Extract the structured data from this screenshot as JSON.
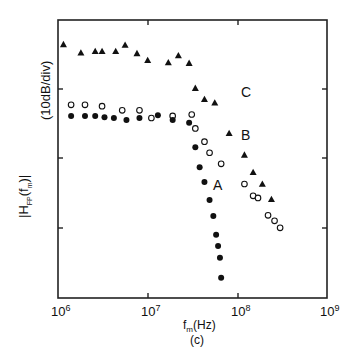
{
  "chart_data": {
    "type": "scatter",
    "title": "",
    "panel_label": "(c)",
    "xlabel": "f_m(Hz)",
    "ylabel": "|H_FP(f_m)|",
    "ylabel_units": "(10dB/div)",
    "xscale": "log",
    "xlim": [
      1000000,
      1000000000
    ],
    "xticks": [
      "10^6",
      "10^7",
      "10^8",
      "10^9"
    ],
    "yscale": "dB, 10 dB per division, 4 divisions, relative",
    "ylim_div": [
      0,
      4
    ],
    "grid": false,
    "legend": "inline curve labels A, B, C",
    "series": [
      {
        "name": "C",
        "marker": "filled-triangle",
        "points": [
          [
            1150000.0,
            3.65
          ],
          [
            1800000.0,
            3.53
          ],
          [
            2600000.0,
            3.55
          ],
          [
            3100000.0,
            3.55
          ],
          [
            4400000.0,
            3.55
          ],
          [
            5600000.0,
            3.64
          ],
          [
            7600000.0,
            3.52
          ],
          [
            10000000.0,
            3.42
          ],
          [
            17000000.0,
            3.39
          ],
          [
            22000000.0,
            3.49
          ],
          [
            29000000.0,
            3.38
          ],
          [
            34000000.0,
            3.02
          ],
          [
            43000000.0,
            2.86
          ],
          [
            56000000.0,
            2.81
          ],
          [
            81000000.0,
            2.37
          ],
          [
            120000000.0,
            2.06
          ],
          [
            150000000.0,
            1.81
          ],
          [
            190000000.0,
            1.64
          ],
          [
            240000000.0,
            1.42
          ]
        ]
      },
      {
        "name": "B",
        "marker": "open-circle",
        "points": [
          [
            1400000.0,
            2.78
          ],
          [
            2000000.0,
            2.78
          ],
          [
            3100000.0,
            2.76
          ],
          [
            5200000.0,
            2.7
          ],
          [
            8100000.0,
            2.7
          ],
          [
            11000000.0,
            2.59
          ],
          [
            19000000.0,
            2.62
          ],
          [
            31000000.0,
            2.64
          ],
          [
            34000000.0,
            2.44
          ],
          [
            43000000.0,
            2.25
          ],
          [
            49000000.0,
            2.09
          ],
          [
            66000000.0,
            1.93
          ],
          [
            120000000.0,
            1.64
          ],
          [
            150000000.0,
            1.47
          ],
          [
            170000000.0,
            1.44
          ],
          [
            220000000.0,
            1.19
          ],
          [
            260000000.0,
            1.11
          ],
          [
            300000000.0,
            1.01
          ]
        ]
      },
      {
        "name": "A",
        "marker": "filled-circle",
        "points": [
          [
            1400000.0,
            2.62
          ],
          [
            2000000.0,
            2.62
          ],
          [
            2600000.0,
            2.62
          ],
          [
            3300000.0,
            2.6
          ],
          [
            4200000.0,
            2.59
          ],
          [
            5800000.0,
            2.56
          ],
          [
            8100000.0,
            2.59
          ],
          [
            13000000.0,
            2.63
          ],
          [
            19000000.0,
            2.56
          ],
          [
            29000000.0,
            2.52
          ],
          [
            34000000.0,
            2.17
          ],
          [
            38000000.0,
            1.88
          ],
          [
            43000000.0,
            1.67
          ],
          [
            49000000.0,
            1.41
          ],
          [
            54000000.0,
            1.18
          ],
          [
            58000000.0,
            0.91
          ],
          [
            61000000.0,
            0.75
          ],
          [
            64000000.0,
            0.58
          ],
          [
            66000000.0,
            0.29
          ]
        ]
      }
    ],
    "annotations": [
      {
        "text": "C",
        "near": "triangles knee"
      },
      {
        "text": "B",
        "near": "open circles knee"
      },
      {
        "text": "A",
        "near": "filled circles drop"
      }
    ]
  },
  "labels": {
    "curve_a": "A",
    "curve_b": "B",
    "curve_c": "C",
    "x_tick_1_base": "10",
    "x_tick_1_exp": "6",
    "x_tick_2_base": "10",
    "x_tick_2_exp": "7",
    "x_tick_3_base": "10",
    "x_tick_3_exp": "8",
    "x_tick_4_base": "10",
    "x_tick_4_exp": "9",
    "xlabel_main": "f",
    "xlabel_sub": "m",
    "xlabel_unit": "(Hz)",
    "panel": "(c)",
    "ylabel_pre": "|H",
    "ylabel_sub": "FP",
    "ylabel_mid": "(f",
    "ylabel_sub2": "m",
    "ylabel_post": ")|",
    "ylabel_units": "(10dB/div)"
  }
}
